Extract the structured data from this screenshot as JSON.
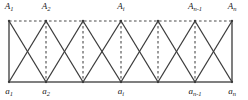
{
  "figure": {
    "type": "graph-diagram",
    "colors": {
      "stroke": "#3a3a3a",
      "dashed_stroke": "#4a4a4a",
      "bottom_rail": "#555555",
      "label": "#1a1a1a",
      "background": "#ffffff"
    },
    "geometry": {
      "width": 248,
      "height": 100,
      "top_rail_y": 21,
      "bottom_rail_y": 82,
      "column_x": [
        9,
        46,
        83,
        121,
        158,
        195,
        232
      ],
      "column_count": 7
    },
    "strokes": {
      "top_rail_style": "dashed",
      "bottom_rail_style": "solid",
      "diagonal_style": "solid",
      "edge_vertical_style": "solid",
      "interior_vertical_style": "dashed"
    },
    "top_labels": [
      {
        "text": "A",
        "subscript": "1",
        "column": 0
      },
      {
        "text": "A",
        "subscript": "2",
        "column": 1
      },
      {
        "text": "A",
        "subscript": "i",
        "column": 3
      },
      {
        "text": "A",
        "subscript": "n-1",
        "column": 5
      },
      {
        "text": "A",
        "subscript": "n",
        "column": 6
      }
    ],
    "bottom_labels": [
      {
        "text": "a",
        "subscript": "1",
        "column": 0
      },
      {
        "text": "a",
        "subscript": "2",
        "column": 1
      },
      {
        "text": "a",
        "subscript": "i",
        "column": 3
      },
      {
        "text": "a",
        "subscript": "n-1",
        "column": 5
      },
      {
        "text": "a",
        "subscript": "n",
        "column": 6
      }
    ]
  }
}
